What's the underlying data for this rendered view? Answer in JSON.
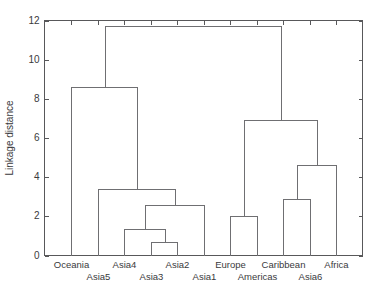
{
  "chart_data": {
    "type": "tree",
    "title": "",
    "subtitle": "",
    "xlabel": "",
    "ylabel": "Linkage distance",
    "ylim": [
      0,
      12
    ],
    "yticks": [
      0,
      2,
      4,
      6,
      8,
      10,
      12
    ],
    "ytick_labels": [
      "0",
      "2",
      "4",
      "6",
      "8",
      "10",
      "12"
    ],
    "grid": false,
    "legend": "none",
    "orientation": "vertical",
    "leaf_order": [
      "Oceania",
      "Asia5",
      "Asia4",
      "Asia3",
      "Asia2",
      "Asia1",
      "Europe",
      "Americas",
      "Caribbean",
      "Asia6",
      "Africa"
    ],
    "leaves": [
      {
        "label": "Oceania",
        "index": 0,
        "row": "top"
      },
      {
        "label": "Asia5",
        "index": 1,
        "row": "bottom"
      },
      {
        "label": "Asia4",
        "index": 2,
        "row": "top"
      },
      {
        "label": "Asia3",
        "index": 3,
        "row": "bottom"
      },
      {
        "label": "Asia2",
        "index": 4,
        "row": "top"
      },
      {
        "label": "Asia1",
        "index": 5,
        "row": "bottom"
      },
      {
        "label": "Europe",
        "index": 6,
        "row": "top"
      },
      {
        "label": "Americas",
        "index": 7,
        "row": "bottom"
      },
      {
        "label": "Caribbean",
        "index": 8,
        "row": "top"
      },
      {
        "label": "Asia6",
        "index": 9,
        "row": "bottom"
      },
      {
        "label": "Africa",
        "index": 10,
        "row": "top"
      }
    ],
    "merges": [
      {
        "id": "m1",
        "left": "Asia3",
        "right": "Asia2",
        "height": 0.7
      },
      {
        "id": "m2",
        "left": "Asia4",
        "right": "m1",
        "height": 1.35
      },
      {
        "id": "m3",
        "left": "m2",
        "right": "Asia1",
        "height": 2.6
      },
      {
        "id": "m4",
        "left": "Asia5",
        "right": "m3",
        "height": 3.4
      },
      {
        "id": "m5",
        "left": "Oceania",
        "right": "m4",
        "height": 8.6
      },
      {
        "id": "m6",
        "left": "Europe",
        "right": "Americas",
        "height": 2.0
      },
      {
        "id": "m7",
        "left": "Caribbean",
        "right": "Asia6",
        "height": 2.9
      },
      {
        "id": "m8",
        "left": "m7",
        "right": "Africa",
        "height": 4.6
      },
      {
        "id": "m9",
        "left": "m6",
        "right": "m8",
        "height": 6.9
      },
      {
        "id": "m10",
        "left": "m5",
        "right": "m9",
        "height": 11.7
      }
    ],
    "colors": {
      "line": "#6f6f72",
      "axis": "#58585a",
      "text": "#3a3a3c",
      "background": "#ffffff"
    }
  }
}
